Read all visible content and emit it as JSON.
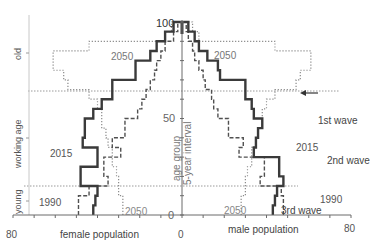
{
  "chart_data": {
    "type": "population-pyramid (step)",
    "title": "",
    "xlabel_left": "female population",
    "xlabel_right": "male population",
    "ylabel": "age group",
    "ylabel_sub": "5-year interval",
    "x_ticks_left": [
      "80",
      "0"
    ],
    "x_ticks_right": [
      "0",
      "80"
    ],
    "y_ticks": [
      "0",
      "50",
      "100"
    ],
    "xlim": [
      -80,
      80
    ],
    "ylim": [
      0,
      100
    ],
    "age_bands": [
      {
        "label": "young",
        "from": 0,
        "to": 15
      },
      {
        "label": "working age",
        "from": 15,
        "to": 75
      },
      {
        "label": "old",
        "from": 75,
        "to": 100
      }
    ],
    "age_groups": [
      0,
      5,
      10,
      15,
      20,
      25,
      30,
      35,
      40,
      45,
      50,
      55,
      60,
      65,
      70,
      75,
      80,
      85,
      90,
      95
    ],
    "series": [
      {
        "name": "1990",
        "style": "dashed",
        "female": [
          49,
          49,
          44,
          35,
          37,
          37,
          29,
          33,
          27,
          27,
          21,
          19,
          17,
          15,
          13,
          12,
          10,
          8,
          4,
          2
        ],
        "male": [
          48,
          48,
          47,
          37,
          39,
          39,
          27,
          29,
          22,
          22,
          17,
          15,
          14,
          11,
          10,
          8,
          6,
          5,
          3,
          2
        ]
      },
      {
        "name": "2015",
        "style": "solid",
        "female": [
          42,
          41,
          40,
          48,
          48,
          40,
          40,
          47,
          46,
          46,
          42,
          38,
          33,
          33,
          22,
          22,
          15,
          12,
          8,
          4
        ],
        "male": [
          43,
          44,
          45,
          48,
          46,
          46,
          34,
          35,
          36,
          38,
          34,
          33,
          30,
          30,
          18,
          17,
          12,
          8,
          6,
          3
        ]
      },
      {
        "name": "2050",
        "style": "dotted",
        "female": [
          28,
          28,
          30,
          30,
          31,
          33,
          33,
          35,
          36,
          38,
          38,
          40,
          44,
          54,
          56,
          61,
          61,
          44,
          8,
          5
        ],
        "male": [
          28,
          28,
          30,
          30,
          31,
          33,
          33,
          35,
          36,
          38,
          38,
          40,
          44,
          54,
          56,
          61,
          61,
          44,
          8,
          5
        ]
      }
    ],
    "annotations": [
      {
        "text": "2050",
        "side": "left-top"
      },
      {
        "text": "2050",
        "side": "right-top"
      },
      {
        "text": "2015",
        "side": "left-middle"
      },
      {
        "text": "2015",
        "side": "right-middle"
      },
      {
        "text": "1990",
        "side": "left-bottom"
      },
      {
        "text": "1990",
        "side": "right-bottom"
      },
      {
        "text": "2050",
        "side": "left-bottom"
      },
      {
        "text": "2050",
        "side": "right-bottom"
      },
      {
        "text": "1st wave",
        "side": "right"
      },
      {
        "text": "2nd wave",
        "side": "right"
      },
      {
        "text": "3rd wave",
        "side": "right-bottom"
      },
      {
        "text": "←",
        "side": "right-arrow-at-age-75"
      }
    ],
    "labels": {
      "x_left_80": "80",
      "x_zero": "0",
      "x_right_80": "80",
      "y_0": "0",
      "y_50": "50",
      "y_100": "100",
      "band_young": "young",
      "band_working": "working age",
      "band_old": "old",
      "lbl_2050_tl": "2050",
      "lbl_2050_tr": "2050",
      "lbl_2015_l": "2015",
      "lbl_2015_r": "2015",
      "lbl_1990_l": "1990",
      "lbl_1990_r": "1990",
      "lbl_2050_bl": "2050",
      "lbl_2050_br": "2050",
      "lbl_wave1": "1st wave",
      "lbl_wave2": "2nd wave",
      "lbl_wave3": "3rd wave",
      "female": "female population",
      "male": "male population",
      "age_group": "age group",
      "interval": "5-year interval"
    },
    "colors": {
      "s2015": "#3a3a3a",
      "s1990": "#505050",
      "s2050": "#8a8a8a",
      "axis": "#6a6a6a",
      "text": "#4a4a4a",
      "text_light": "#8a8a8a"
    }
  }
}
